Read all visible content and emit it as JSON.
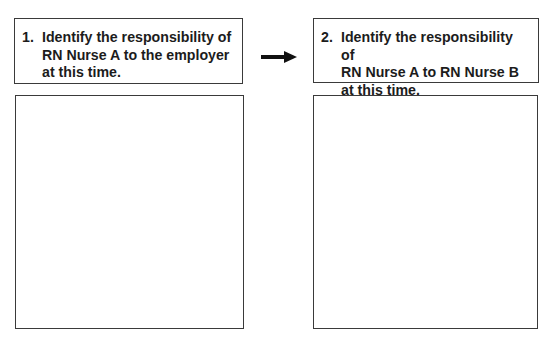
{
  "prompts": [
    {
      "number": "1.",
      "text": "Identify the responsibility of\nRN Nurse A to the employer\nat this time."
    },
    {
      "number": "2.",
      "text": "Identify the responsibility of\nRN Nurse A to RN Nurse B\nat this time."
    }
  ],
  "answer_boxes": [
    {
      "content": ""
    },
    {
      "content": ""
    }
  ],
  "connector": {
    "icon": "right-arrow-icon",
    "color": "#111111"
  }
}
